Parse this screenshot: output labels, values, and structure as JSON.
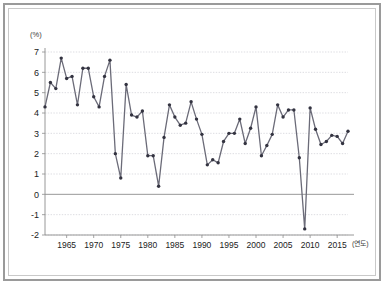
{
  "chart_data": {
    "type": "line",
    "title": "",
    "subtitle": "",
    "xlabel": "(연도)",
    "ylabel": "(%)",
    "ylim": [
      -2,
      7
    ],
    "xlim": [
      1961,
      2017
    ],
    "grid": true,
    "legend": null,
    "y_ticks": [
      7,
      6,
      5,
      4,
      3,
      2,
      1,
      0,
      -1,
      -2
    ],
    "y_tick_labels": [
      "7",
      "6",
      "5",
      "4",
      "3",
      "2",
      "1",
      "0",
      "-1",
      "-2"
    ],
    "x_ticks": [
      1965,
      1970,
      1975,
      1980,
      1985,
      1990,
      1995,
      2000,
      2005,
      2010,
      2015
    ],
    "x_tick_labels": [
      "1965",
      "1970",
      "1975",
      "1980",
      "1985",
      "1990",
      "1995",
      "2000",
      "2005",
      "2010",
      "2015"
    ],
    "x": [
      1961,
      1962,
      1963,
      1964,
      1965,
      1966,
      1967,
      1968,
      1969,
      1970,
      1971,
      1972,
      1973,
      1974,
      1975,
      1976,
      1977,
      1978,
      1979,
      1980,
      1981,
      1982,
      1983,
      1984,
      1985,
      1986,
      1987,
      1988,
      1989,
      1990,
      1991,
      1992,
      1993,
      1994,
      1995,
      1996,
      1997,
      1998,
      1999,
      2000,
      2001,
      2002,
      2003,
      2004,
      2005,
      2006,
      2007,
      2008,
      2009,
      2010,
      2011,
      2012,
      2013,
      2014,
      2015,
      2016,
      2017
    ],
    "values": [
      4.3,
      5.5,
      5.2,
      6.7,
      5.7,
      5.8,
      4.4,
      6.2,
      6.2,
      4.8,
      4.3,
      5.8,
      6.6,
      2.0,
      0.8,
      5.4,
      3.9,
      3.8,
      4.1,
      1.9,
      1.9,
      0.4,
      2.8,
      4.4,
      3.8,
      3.4,
      3.5,
      4.55,
      3.7,
      2.95,
      1.45,
      1.7,
      1.55,
      2.6,
      3.0,
      3.0,
      3.7,
      2.5,
      3.25,
      4.3,
      1.9,
      2.4,
      2.95,
      4.4,
      3.8,
      4.15,
      4.15,
      1.8,
      -1.7,
      4.25,
      3.2,
      2.45,
      2.6,
      2.9,
      2.85,
      2.5,
      3.1
    ],
    "series_name": "growth-rate",
    "line_color": "#6b6b78",
    "marker_color": "#333340",
    "grid_color": "#cfcfd6",
    "axis_color": "#8d8d8d",
    "annotations": []
  }
}
